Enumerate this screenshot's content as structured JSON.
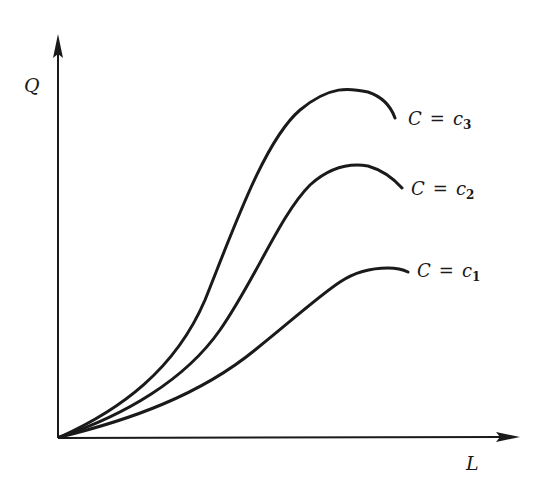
{
  "diagram": {
    "type": "production-curves",
    "y_axis": {
      "label": "Q"
    },
    "x_axis": {
      "label": "L"
    },
    "curves": [
      {
        "id": "c3",
        "label_lhs": "C",
        "label_eq": "=",
        "label_var": "c",
        "label_sub": "3"
      },
      {
        "id": "c2",
        "label_lhs": "C",
        "label_eq": "=",
        "label_var": "c",
        "label_sub": "2"
      },
      {
        "id": "c1",
        "label_lhs": "C",
        "label_eq": "=",
        "label_var": "c",
        "label_sub": "1"
      }
    ],
    "colors": {
      "line": "#1a1a1a",
      "background": "#ffffff"
    }
  }
}
